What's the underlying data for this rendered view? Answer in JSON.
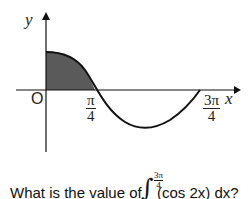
{
  "graph": {
    "y_axis_label": "y",
    "x_axis_label": "x",
    "origin_label": "O",
    "tick_pi_over_4": {
      "num": "π",
      "den": "4"
    },
    "tick_3pi_over_4": {
      "num": "3π",
      "den": "4"
    },
    "curve": "y = cos(2x)",
    "shaded_region": "between curve and x-axis from 0 to π/4",
    "shade_color": "#5a5a5a",
    "line_color": "#111111"
  },
  "question": {
    "prefix": "What is the value of",
    "integral_upper": {
      "num": "3π",
      "den": "4"
    },
    "integrand": "(cos 2x) dx?"
  }
}
